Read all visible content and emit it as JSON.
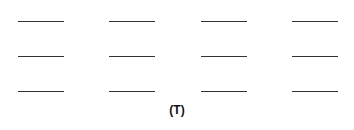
{
  "figure": {
    "label": "(T)",
    "rows": 3,
    "columns": 4,
    "blanks": [
      {
        "row": 0,
        "col": 0
      },
      {
        "row": 0,
        "col": 1
      },
      {
        "row": 0,
        "col": 2
      },
      {
        "row": 0,
        "col": 3
      },
      {
        "row": 1,
        "col": 0
      },
      {
        "row": 1,
        "col": 1
      },
      {
        "row": 1,
        "col": 2
      },
      {
        "row": 1,
        "col": 3
      },
      {
        "row": 2,
        "col": 0
      },
      {
        "row": 2,
        "col": 1
      },
      {
        "row": 2,
        "col": 2
      },
      {
        "row": 2,
        "col": 3
      }
    ],
    "line_color": "#333333"
  }
}
